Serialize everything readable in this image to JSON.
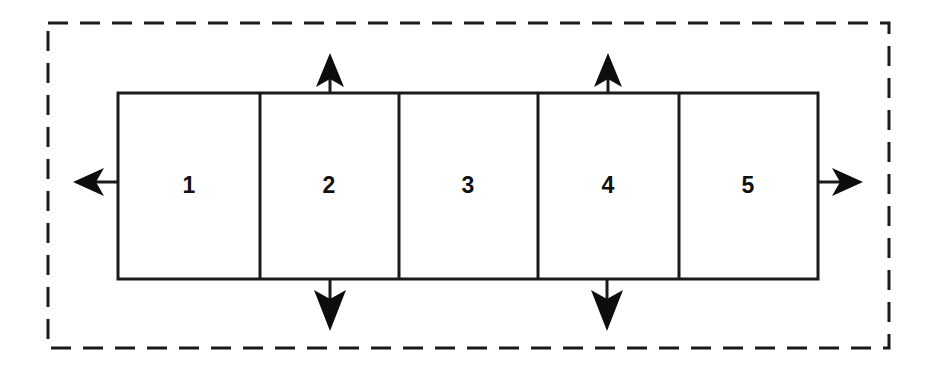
{
  "diagram": {
    "type": "block-diagram",
    "canvas": {
      "width": 933,
      "height": 369,
      "background": "#ffffff"
    },
    "boundary": {
      "name": "system-boundary",
      "style": "dashed",
      "color": "#1a1a1a",
      "stroke_width": 3,
      "dash": "20 12",
      "x": 48,
      "y": 23,
      "width": 841,
      "height": 325
    },
    "block": {
      "name": "segmented-block",
      "color": "#1a1a1a",
      "fill": "#ffffff",
      "stroke_width": 3,
      "x": 118,
      "y": 93,
      "width": 700,
      "height": 186
    },
    "dividers": [
      260,
      399,
      538,
      679
    ],
    "cells": [
      {
        "label": "1",
        "cx": 189,
        "cy": 186
      },
      {
        "label": "2",
        "cx": 329,
        "cy": 186
      },
      {
        "label": "3",
        "cx": 468,
        "cy": 186
      },
      {
        "label": "4",
        "cx": 608,
        "cy": 186
      },
      {
        "label": "5",
        "cx": 748,
        "cy": 186
      }
    ],
    "arrows": [
      {
        "name": "arrow-left-out",
        "direction": "left",
        "x": 118,
        "y": 182,
        "length": 45
      },
      {
        "name": "arrow-right-out",
        "direction": "right",
        "x": 818,
        "y": 182,
        "length": 45
      },
      {
        "name": "arrow-up-cell2",
        "direction": "up",
        "x": 330,
        "y": 93,
        "length": 41
      },
      {
        "name": "arrow-up-cell4",
        "direction": "up",
        "x": 608,
        "y": 93,
        "length": 41
      },
      {
        "name": "arrow-down-cell2",
        "direction": "down",
        "x": 330,
        "y": 279,
        "length": 49
      },
      {
        "name": "arrow-down-cell4",
        "direction": "down",
        "x": 607,
        "y": 279,
        "length": 49
      }
    ]
  }
}
